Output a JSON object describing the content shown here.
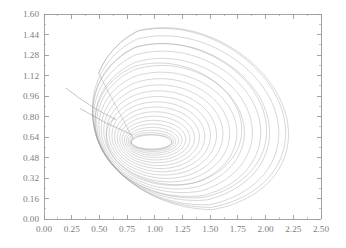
{
  "figure": {
    "title": "",
    "background_color": "#ffffff",
    "axis_color": "#9a9a9a",
    "label_color": "#7d7d7d",
    "curve_color": "#9d9d9d",
    "plot_box": {
      "left": 44,
      "top": 14,
      "right": 321,
      "bottom": 219
    }
  },
  "chart_data": {
    "type": "line",
    "title": "",
    "xlabel": "",
    "ylabel": "",
    "xlim": [
      0.0,
      2.5
    ],
    "ylim": [
      0.0,
      1.6
    ],
    "grid": false,
    "legend": null,
    "x_ticks": [
      0.0,
      0.25,
      0.5,
      0.75,
      1.0,
      1.25,
      1.5,
      1.75,
      2.0,
      2.25,
      2.5
    ],
    "x_tick_labels": [
      "0.00",
      "0.25",
      "0.50",
      "0.75",
      "1.00",
      "1.25",
      "1.50",
      "1.75",
      "2.00",
      "2.25",
      "2.50"
    ],
    "y_ticks": [
      0.0,
      0.16,
      0.32,
      0.48,
      0.64,
      0.8,
      0.96,
      1.12,
      1.28,
      1.44,
      1.6
    ],
    "y_tick_labels": [
      "0.00",
      "0.16",
      "0.32",
      "0.48",
      "0.64",
      "0.80",
      "0.96",
      "1.12",
      "1.28",
      "1.44",
      "1.60"
    ],
    "x_minor_per_major": 2,
    "y_minor_per_major": 2,
    "series": [
      {
        "name": "trajectory",
        "description": "inward-spiralling phase-plane orbit",
        "start_point": [
          0.2,
          1.02
        ],
        "converges_to": [
          0.97,
          0.6
        ],
        "outer_extent": {
          "xmin": 0.205,
          "xmax": 2.155,
          "ymin": 0.0,
          "ymax": 1.495
        },
        "inner_extent": {
          "xmin": 0.8,
          "xmax": 1.16,
          "ymin": 0.545,
          "ymax": 0.655
        },
        "loop_count": 24
      }
    ]
  }
}
